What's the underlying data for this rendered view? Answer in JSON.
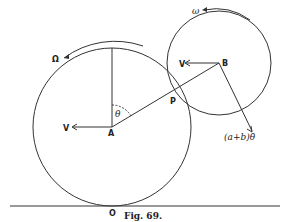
{
  "figure": {
    "caption": "Fig. 69.",
    "labels": {
      "big_rotation": "Ω",
      "small_rotation": "ω",
      "center_a": "A",
      "center_b": "B",
      "contact_point": "P",
      "ground_point": "O",
      "angle": "θ",
      "velocity_a": "V",
      "velocity_b": "V",
      "relative_velocity": "(a+b)θ̇"
    }
  }
}
